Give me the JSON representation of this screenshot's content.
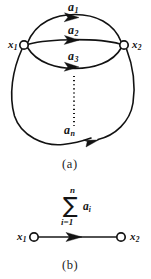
{
  "figure": {
    "background_color": "#ffffff",
    "ink_color": "#121212"
  },
  "panel_a": {
    "caption": "(a)",
    "nodes": [
      {
        "id": "x1",
        "label": "x",
        "subscript": "1",
        "cx": 24,
        "cy": 45,
        "r": 4.2
      },
      {
        "id": "x2",
        "label": "x",
        "subscript": "2",
        "cx": 124,
        "cy": 45,
        "r": 4.2
      }
    ],
    "edges": [
      {
        "id": "a1",
        "label": "a",
        "subscript": "1",
        "label_x": 68,
        "label_y": 6,
        "arrow_x": 74,
        "arrow_y": 22
      },
      {
        "id": "a2",
        "label": "a",
        "subscript": "2",
        "label_x": 68,
        "label_y": 29,
        "arrow_x": 74,
        "arrow_y": 44
      },
      {
        "id": "a3",
        "label": "a",
        "subscript": "3",
        "label_x": 68,
        "label_y": 55,
        "arrow_x": 74,
        "arrow_y": 70
      },
      {
        "id": "an",
        "label": "a",
        "subscript": "n",
        "label_x": 66,
        "label_y": 128,
        "arrow_x": 93,
        "arrow_y": 140
      }
    ],
    "ellipsis": {
      "kind": "vertical-dotted",
      "x": 74,
      "y_start": 76,
      "y_end": 126
    }
  },
  "panel_b": {
    "caption": "(b)",
    "nodes": [
      {
        "id": "x1",
        "label": "x",
        "subscript": "1",
        "cx": 34,
        "cy": 237,
        "r": 4.2
      },
      {
        "id": "x2",
        "label": "x",
        "subscript": "2",
        "cx": 121,
        "cy": 237,
        "r": 4.2
      }
    ],
    "edge": {
      "id": "sum-edge",
      "arrow_x": 79,
      "arrow_y": 237
    },
    "summation": {
      "operator": "∑",
      "upper_limit": "n",
      "lower_limit": "i=1",
      "term": "a",
      "term_subscript": "i"
    }
  }
}
